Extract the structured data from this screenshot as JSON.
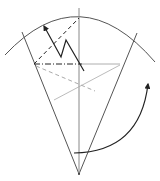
{
  "diagram": {
    "type": "origami-fold-step",
    "colors": {
      "line": "#444444",
      "light_line": "#999999",
      "arrow": "#222222",
      "background": "#ffffff"
    },
    "elements": [
      {
        "id": "outer-arc",
        "kind": "arc",
        "style": "solid"
      },
      {
        "id": "left-edge",
        "kind": "line",
        "style": "solid"
      },
      {
        "id": "right-edge",
        "kind": "line",
        "style": "solid"
      },
      {
        "id": "center-crease",
        "kind": "line",
        "style": "solid-gray"
      },
      {
        "id": "mountain-fold",
        "kind": "line",
        "style": "dash-dot"
      },
      {
        "id": "valley-fold",
        "kind": "line",
        "style": "dashed"
      },
      {
        "id": "fold-arrow",
        "kind": "zigzag-arrow"
      },
      {
        "id": "reference-crease-dashed",
        "kind": "line",
        "style": "dashed-gray"
      },
      {
        "id": "reference-crease",
        "kind": "line",
        "style": "thin-gray"
      },
      {
        "id": "turn-over-arrow",
        "kind": "curved-arrow"
      }
    ]
  }
}
